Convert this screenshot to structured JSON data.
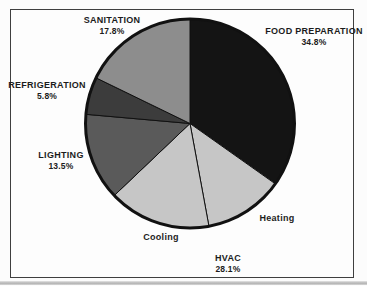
{
  "figure": {
    "background": "#fcfcfc",
    "frame_border_color": "#3f3f3f"
  },
  "chart_data": {
    "type": "pie",
    "title": "",
    "units": "%",
    "start_angle_deg": 0,
    "direction": "clockwise",
    "outline_color": "#111111",
    "slices": [
      {
        "label": "FOOD PREPARATION",
        "value": 34.8,
        "display_pct": "34.8%",
        "color": "#141414"
      },
      {
        "label": "Heating",
        "value": 12.3,
        "color": "#c6c6c6",
        "part_of": "HVAC"
      },
      {
        "label": "Cooling",
        "value": 15.8,
        "color": "#c6c6c6",
        "part_of": "HVAC"
      },
      {
        "label": "LIGHTING",
        "value": 13.5,
        "display_pct": "13.5%",
        "color": "#5a5a5a"
      },
      {
        "label": "REFRIGERATION",
        "value": 5.8,
        "display_pct": "5.8%",
        "color": "#3c3c3c"
      },
      {
        "label": "SANITATION",
        "value": 17.8,
        "display_pct": "17.8%",
        "color": "#8d8d8d"
      }
    ],
    "group": {
      "label": "HVAC",
      "value": 28.1,
      "display_pct": "28.1%",
      "members": [
        "Heating",
        "Cooling"
      ]
    }
  },
  "labels": {
    "sanitation": {
      "name": "SANITATION",
      "pct": "17.8%"
    },
    "food_preparation": {
      "name": "FOOD PREPARATION",
      "pct": "34.8%"
    },
    "refrigeration": {
      "name": "REFRIGERATION",
      "pct": "5.8%"
    },
    "lighting": {
      "name": "LIGHTING",
      "pct": "13.5%"
    },
    "cooling": {
      "name": "Cooling"
    },
    "heating": {
      "name": "Heating"
    },
    "hvac": {
      "name": "HVAC",
      "pct": "28.1%"
    }
  }
}
